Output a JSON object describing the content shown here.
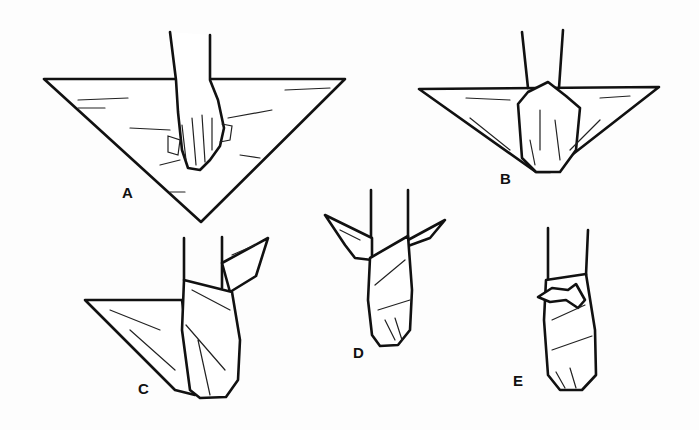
{
  "figure": {
    "steps": [
      {
        "id": "A",
        "label": "A"
      },
      {
        "id": "B",
        "label": "B"
      },
      {
        "id": "C",
        "label": "C"
      },
      {
        "id": "D",
        "label": "D"
      },
      {
        "id": "E",
        "label": "E"
      }
    ],
    "colors": {
      "ink": "#111111",
      "paper": "#fdfdfd"
    }
  }
}
